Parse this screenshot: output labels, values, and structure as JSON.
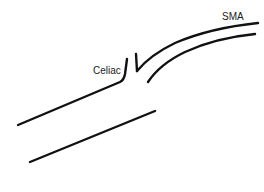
{
  "diagram": {
    "type": "anatomical-vessel-sketch",
    "labels": {
      "celiac": "Celiac",
      "sma": "SMA"
    },
    "colors": {
      "line": "#111111",
      "text": "#1a1a1a",
      "background": "#ffffff"
    },
    "structures": [
      {
        "name": "aorta",
        "description": "main vessel shown as two parallel walls"
      },
      {
        "name": "celiac",
        "description": "short branch arising from upper aortic wall"
      },
      {
        "name": "sma",
        "description": "superior mesenteric artery curving up and to the right"
      }
    ]
  }
}
